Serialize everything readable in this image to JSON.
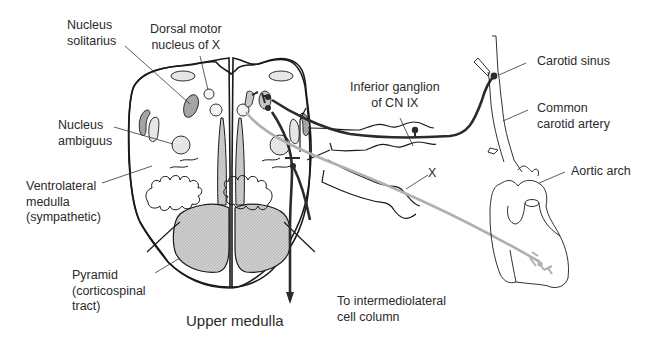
{
  "diagram": {
    "title": "Upper medulla",
    "labels": {
      "nucleus_solitarius": "Nucleus\nsolitarius",
      "dorsal_motor_nucleus": "Dorsal motor\nnucleus of X",
      "nucleus_ambiguus": "Nucleus\nambiguus",
      "ventrolateral_medulla": "Ventrolateral\nmedulla\n(sympathetic)",
      "pyramid": "Pyramid\n(corticospinal\ntract)",
      "inferior_ganglion": "Inferior ganglion\nof CN IX",
      "vagus_nerve": "X",
      "carotid_sinus": "Carotid sinus",
      "common_carotid": "Common\ncarotid artery",
      "aortic_arch": "Aortic arch",
      "intermediolateral": "To intermediolateral\ncell column"
    },
    "colors": {
      "outline": "#1a1a1a",
      "dark_pathway": "#2b2b2b",
      "light_pathway": "#b0b0b0",
      "nucleus_fill_dark": "#a8a8a8",
      "nucleus_fill_light": "#e4e4e4",
      "pyramid_fill": "#c9c9c9",
      "text": "#2a2a2a"
    }
  }
}
